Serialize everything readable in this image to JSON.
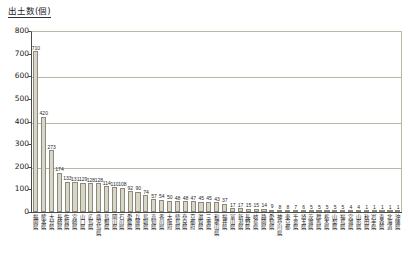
{
  "chart_data": {
    "type": "bar",
    "title": "出土数(個)",
    "xlabel": "",
    "ylabel": "出土数(個)",
    "ylim": [
      0,
      800
    ],
    "ytick_labels": [
      "800",
      "700",
      "600",
      "500",
      "400",
      "300",
      "200",
      "100",
      "0"
    ],
    "ytick_values": [
      800,
      700,
      600,
      500,
      400,
      300,
      200,
      100,
      0
    ],
    "grid": true,
    "gridlines_at": [
      800,
      600,
      400,
      200
    ],
    "legend": null,
    "bar_color": "#d8d6c6",
    "bar_border_color": "#8c897a",
    "axis_color": "#4a4a4a",
    "gridline_color": "#b9b6a6",
    "categories": [
      "福岡県",
      "熊本県",
      "大分県",
      "長崎県",
      "佐賀県",
      "宮崎県",
      "山口県",
      "広島県",
      "鹿児島県",
      "島根県",
      "岡山県",
      "石川県",
      "愛媛県",
      "兵庫県",
      "鳥取県",
      "高知県",
      "香川県",
      "大阪府",
      "徳島県",
      "奈良県",
      "京都府",
      "滋賀県",
      "三重県",
      "和歌山県",
      "福井県",
      "富山県",
      "新潟県",
      "長野県",
      "岐阜県",
      "静岡県",
      "愛知県",
      "神奈川県",
      "東京都",
      "千葉県",
      "埼玉県",
      "茨城県",
      "群馬県",
      "栃木県",
      "山梨県",
      "福島県",
      "宮城県",
      "山形県",
      "秋田県",
      "岩手県",
      "青森県",
      "北海道",
      "沖縄県"
    ],
    "values": [
      710,
      420,
      273,
      174,
      133,
      131,
      129,
      128,
      128,
      114,
      110,
      108,
      92,
      90,
      74,
      57,
      54,
      50,
      48,
      48,
      47,
      45,
      45,
      43,
      37,
      17,
      17,
      15,
      15,
      14,
      9,
      8,
      8,
      7,
      6,
      5,
      5,
      5,
      5,
      5,
      4,
      4,
      1,
      1,
      1,
      1,
      1
    ],
    "value_labels": [
      "710",
      "420",
      "273",
      "174",
      "133",
      "131",
      "129",
      "128",
      "128",
      "114",
      "110",
      "108",
      "92",
      "90",
      "74",
      "57",
      "54",
      "50",
      "48",
      "48",
      "47",
      "45",
      "45",
      "43",
      "37",
      "17",
      "17",
      "15",
      "15",
      "14",
      "9",
      "8",
      "8",
      "7",
      "6",
      "5",
      "5",
      "5",
      "5",
      "5",
      "4",
      "4",
      "1",
      "1",
      "1",
      "1",
      "1"
    ]
  }
}
